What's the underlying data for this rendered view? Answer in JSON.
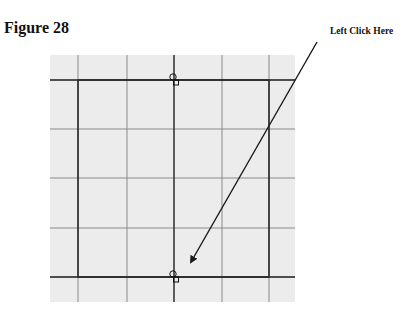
{
  "figure": {
    "title": "Figure 28"
  },
  "callout": {
    "label": "Left Click Here",
    "arrow": {
      "from": [
        317,
        42
      ],
      "to": [
        189,
        266
      ]
    }
  },
  "grid": {
    "area": {
      "x": 50,
      "y": 55,
      "width": 245,
      "height": 247
    },
    "background": "#ececec",
    "minor_line_color": "#8a8a8a",
    "major_line_color": "#2a2a2a",
    "vertical_lines_x": [
      78,
      127,
      174,
      222,
      269
    ],
    "horizontal_lines_y": [
      80,
      129,
      178,
      228,
      277
    ]
  },
  "shape": {
    "type": "rectangle",
    "x": 78,
    "y": 80,
    "width": 191,
    "height": 197,
    "stroke": "#2a2a2a"
  },
  "handles": [
    {
      "name": "top-midpoint-handle",
      "x": 174,
      "y": 80
    },
    {
      "name": "bottom-midpoint-handle",
      "x": 174,
      "y": 277
    }
  ]
}
